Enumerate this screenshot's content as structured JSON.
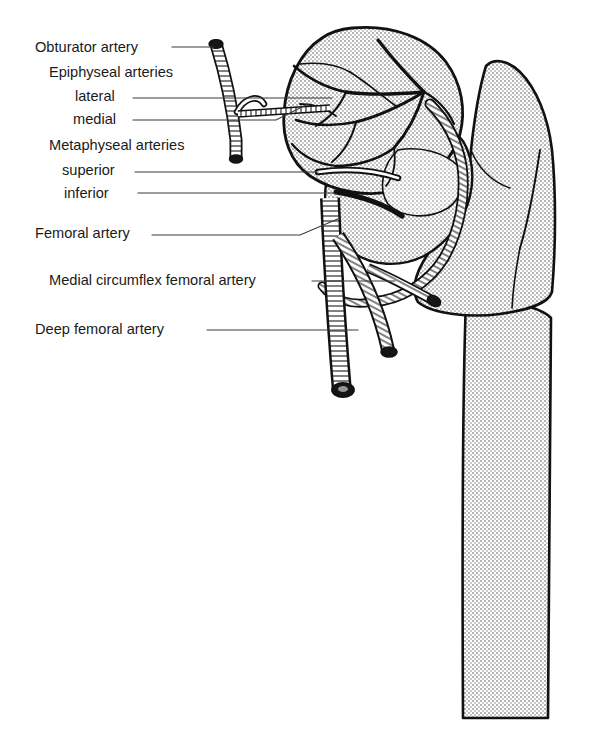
{
  "figure": {
    "style": "black line drawing with stippled halftone gray bone fill on white background",
    "width": 597,
    "height": 745,
    "colors": {
      "background": "#ffffff",
      "outline": "#111111",
      "bone_fill": "#d4d4d4",
      "bone_fill_light": "#dedede",
      "vessel_fill": "#ffffff",
      "vessel_lumen": "#151515",
      "leader_line": "#3a3a3a",
      "text": "#1a1a1a"
    }
  },
  "labels": [
    {
      "id": "obturator-artery",
      "text": "Obturator artery",
      "x": 35,
      "y": 52,
      "indent": 0,
      "leader": {
        "from_x": 172,
        "to_x": 214,
        "y": 47,
        "bend_x": null,
        "bend_y": null
      }
    },
    {
      "id": "epiphyseal-arteries-heading",
      "text": "Epiphyseal arteries",
      "x": 49,
      "y": 77,
      "indent": 1,
      "leader": null
    },
    {
      "id": "epiphyseal-lateral",
      "text": "lateral",
      "x": 75,
      "y": 101,
      "indent": 2,
      "leader": {
        "from_x": 133,
        "to_x": 332,
        "y": 98,
        "bend_x": null,
        "bend_y": null
      }
    },
    {
      "id": "epiphyseal-medial",
      "text": "medial",
      "x": 73,
      "y": 124,
      "indent": 2,
      "leader": {
        "from_x": 133,
        "to_x": 276,
        "y": 120,
        "bend_x": 308,
        "bend_y": 104
      }
    },
    {
      "id": "metaphyseal-arteries-heading",
      "text": "Metaphyseal arteries",
      "x": 49,
      "y": 150,
      "indent": 1,
      "leader": null
    },
    {
      "id": "metaphyseal-superior",
      "text": "superior",
      "x": 62,
      "y": 175,
      "indent": 2,
      "leader": {
        "from_x": 135,
        "to_x": 318,
        "y": 172,
        "bend_x": null,
        "bend_y": null
      }
    },
    {
      "id": "metaphyseal-inferior",
      "text": "inferior",
      "x": 64,
      "y": 198,
      "indent": 2,
      "leader": {
        "from_x": 138,
        "to_x": 335,
        "y": 193,
        "bend_x": null,
        "bend_y": null
      }
    },
    {
      "id": "femoral-artery",
      "text": "Femoral artery",
      "x": 35,
      "y": 238,
      "indent": 0,
      "leader": {
        "from_x": 152,
        "to_x": 300,
        "y": 235,
        "bend_x": 340,
        "bend_y": 218
      }
    },
    {
      "id": "medial-circumflex-femoral",
      "text": "Medial circumflex femoral artery",
      "x": 49,
      "y": 285,
      "indent": 1,
      "leader": {
        "from_x": 312,
        "to_x": 395,
        "y": 281,
        "bend_x": null,
        "bend_y": null
      }
    },
    {
      "id": "deep-femoral-artery",
      "text": "Deep femoral artery",
      "x": 35,
      "y": 334,
      "indent": 0,
      "leader": {
        "from_x": 207,
        "to_x": 358,
        "y": 330,
        "bend_x": null,
        "bend_y": null
      }
    }
  ],
  "structures": [
    {
      "id": "femoral-head",
      "name": "Femoral head",
      "kind": "bone"
    },
    {
      "id": "femoral-neck",
      "name": "Femoral neck",
      "kind": "bone"
    },
    {
      "id": "greater-trochanter",
      "name": "Greater trochanter",
      "kind": "bone"
    },
    {
      "id": "femoral-shaft",
      "name": "Femoral shaft",
      "kind": "bone"
    },
    {
      "id": "obturator-vessel",
      "name": "Obturator artery vessel",
      "kind": "vessel"
    },
    {
      "id": "epiphyseal-network",
      "name": "Epiphyseal arterial network",
      "kind": "vessel"
    },
    {
      "id": "metaphyseal-vessels",
      "name": "Metaphyseal arteries",
      "kind": "vessel"
    },
    {
      "id": "femoral-vessel",
      "name": "Femoral artery vessel",
      "kind": "vessel"
    },
    {
      "id": "circumflex-vessel",
      "name": "Medial circumflex femoral vessel",
      "kind": "vessel"
    },
    {
      "id": "deep-femoral-vessel",
      "name": "Deep femoral artery vessel",
      "kind": "vessel"
    }
  ]
}
